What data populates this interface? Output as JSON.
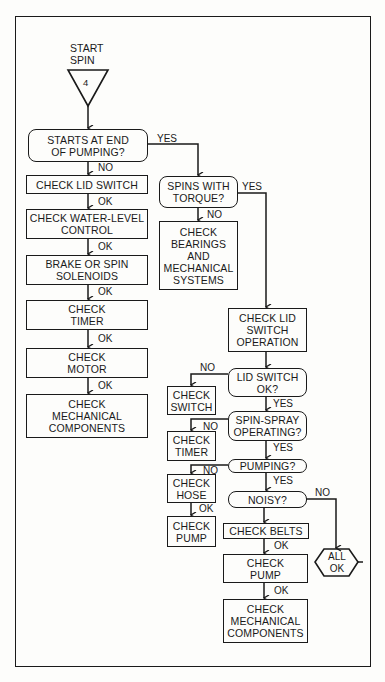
{
  "diagram": {
    "type": "troubleshooting-flowchart",
    "start": {
      "label_line1": "START",
      "label_line2": "SPIN",
      "connector_number": "4"
    },
    "left_branch": {
      "decision_1": {
        "line1": "STARTS AT END",
        "line2": "OF PUMPING?"
      },
      "no_label": "NO",
      "yes_label": "YES",
      "steps": [
        {
          "line1": "CHECK LID SWITCH",
          "line2": "",
          "next_label": "OK"
        },
        {
          "line1": "CHECK WATER-LEVEL",
          "line2": "CONTROL",
          "next_label": "OK"
        },
        {
          "line1": "BRAKE OR SPIN",
          "line2": "SOLENOIDS",
          "next_label": "OK"
        },
        {
          "line1": "CHECK",
          "line2": "TIMER",
          "next_label": "OK"
        },
        {
          "line1": "CHECK",
          "line2": "MOTOR",
          "next_label": "OK"
        },
        {
          "line1": "CHECK",
          "line2": "MECHANICAL",
          "line3": "COMPONENTS"
        }
      ]
    },
    "middle_branch": {
      "decision": {
        "line1": "SPINS WITH",
        "line2": "TORQUE?"
      },
      "yes_label": "YES",
      "no_label": "NO",
      "action": {
        "line1": "CHECK",
        "line2": "BEARINGS",
        "line3": "AND",
        "line4": "MECHANICAL",
        "line5": "SYSTEMS"
      }
    },
    "right_branch": {
      "lid_operation": {
        "line1": "CHECK LID",
        "line2": "SWITCH",
        "line3": "OPERATION"
      },
      "lid_ok": {
        "line1": "LID SWITCH",
        "line2": "OK?",
        "yes_label": "YES",
        "no_label": "NO"
      },
      "check_switch": {
        "line1": "CHECK",
        "line2": "SWITCH"
      },
      "spin_spray": {
        "line1": "SPIN-SPRAY",
        "line2": "OPERATING?",
        "yes_label": "YES",
        "no_label": "NO"
      },
      "check_timer": {
        "line1": "CHECK",
        "line2": "TIMER"
      },
      "pumping": {
        "line1": "PUMPING?",
        "yes_label": "YES",
        "no_label": "NO"
      },
      "check_hose": {
        "line1": "CHECK",
        "line2": "HOSE",
        "ok_label": "OK"
      },
      "check_pump_small": {
        "line1": "CHECK",
        "line2": "PUMP"
      },
      "noisy": {
        "line1": "NOISY?",
        "no_label": "NO"
      },
      "check_belts": {
        "line1": "CHECK BELTS",
        "ok_label": "OK"
      },
      "check_pump": {
        "line1": "CHECK",
        "line2": "PUMP",
        "ok_label": "OK"
      },
      "check_mech": {
        "line1": "CHECK",
        "line2": "MECHANICAL",
        "line3": "COMPONENTS"
      },
      "all_ok": {
        "line1": "ALL",
        "line2": "OK"
      }
    }
  }
}
